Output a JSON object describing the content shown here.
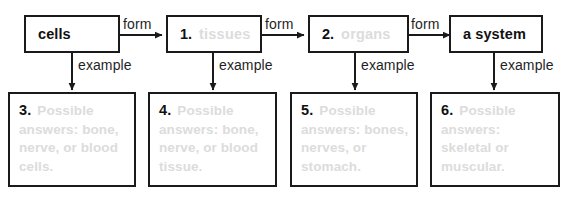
{
  "diagram": {
    "type": "flow-chart-worksheet",
    "top_row": [
      {
        "number": "",
        "label": "cells",
        "filled_answer": "",
        "style": "bold-black"
      },
      {
        "number": "1.",
        "label": "",
        "filled_answer": "tissues",
        "style": "faded-answer"
      },
      {
        "number": "2.",
        "label": "",
        "filled_answer": "organs",
        "style": "faded-answer"
      },
      {
        "number": "",
        "label": "a system",
        "filled_answer": "",
        "style": "bold-black"
      }
    ],
    "bottom_row": [
      {
        "number": "3.",
        "filled_answer": "Possible answers: bone, nerve, or blood cells."
      },
      {
        "number": "4.",
        "filled_answer": "Possible answers: bone, nerve, or blood tissue."
      },
      {
        "number": "5.",
        "filled_answer": "Possible answers: bones, nerves, or stomach."
      },
      {
        "number": "6.",
        "filled_answer": "Possible answers: skeletal or muscular."
      }
    ],
    "horizontal_connectors": [
      {
        "label": "form"
      },
      {
        "label": "form"
      },
      {
        "label": "form"
      }
    ],
    "vertical_connectors": [
      {
        "label": "example"
      },
      {
        "label": "example"
      },
      {
        "label": "example"
      },
      {
        "label": "example"
      }
    ],
    "colors": {
      "box_border": "#1a1a1a",
      "text": "#111111",
      "faded_answer_text": "#dcdcdc",
      "background": "#ffffff"
    }
  }
}
